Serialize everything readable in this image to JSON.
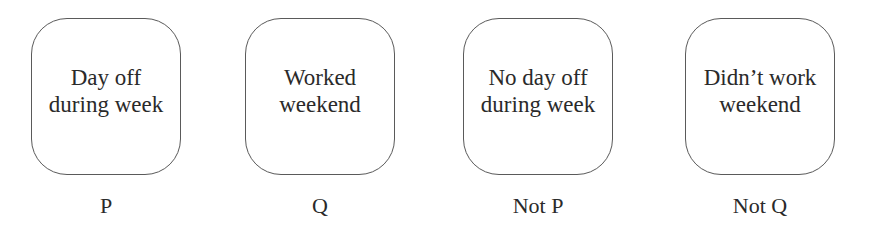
{
  "diagram": {
    "cards": [
      {
        "text": "Day off\nduring week",
        "label": "P"
      },
      {
        "text": "Worked\nweekend",
        "label": "Q"
      },
      {
        "text": "No day off\nduring week",
        "label": "Not P"
      },
      {
        "text": "Didn’t work\nweekend",
        "label": "Not Q"
      }
    ]
  }
}
